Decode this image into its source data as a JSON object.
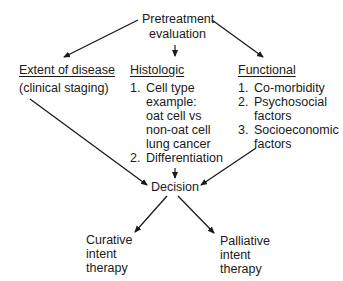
{
  "diagram": {
    "root": {
      "line1": "Pretreatment",
      "line2": "evaluation"
    },
    "branches": {
      "extent": {
        "title": "Extent of disease",
        "subtitle": "(clinical staging)"
      },
      "histologic": {
        "title": "Histologic",
        "items": [
          {
            "num": "1.",
            "lines": [
              "Cell type",
              "example:",
              "oat cell vs",
              "non-oat cell",
              "lung cancer"
            ]
          },
          {
            "num": "2.",
            "lines": [
              "Differentiation"
            ]
          }
        ]
      },
      "functional": {
        "title": "Functional",
        "items": [
          {
            "num": "1.",
            "lines": [
              "Co-morbidity"
            ]
          },
          {
            "num": "2.",
            "lines": [
              "Psychosocial",
              "factors"
            ]
          },
          {
            "num": "3.",
            "lines": [
              "Socioeconomic",
              "factors"
            ]
          }
        ]
      }
    },
    "decision": "Decision",
    "outcomes": {
      "curative": {
        "line1": "Curative",
        "line2": "intent",
        "line3": "therapy"
      },
      "palliative": {
        "line1": "Palliative",
        "line2": "intent",
        "line3": "therapy"
      }
    },
    "colors": {
      "line": "#1a1a1a",
      "background": "#ffffff"
    }
  }
}
